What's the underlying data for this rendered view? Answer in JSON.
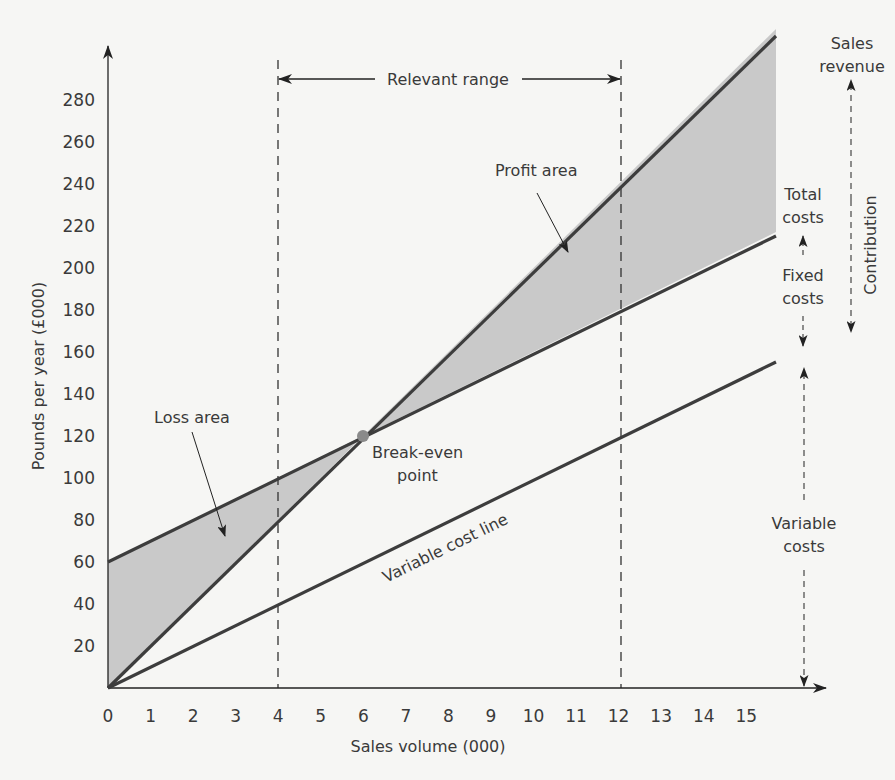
{
  "chart_data": {
    "type": "line",
    "title": "",
    "xlabel": "Sales volume (000)",
    "ylabel": "Pounds per year (£000)",
    "xlim": [
      0,
      16
    ],
    "ylim": [
      0,
      300
    ],
    "x_ticks": [
      0,
      1,
      2,
      3,
      4,
      5,
      6,
      7,
      8,
      9,
      10,
      11,
      12,
      13,
      14,
      15
    ],
    "y_ticks": [
      20,
      40,
      60,
      80,
      100,
      120,
      140,
      160,
      180,
      200,
      220,
      240,
      260,
      280
    ],
    "grid": false,
    "series": [
      {
        "name": "Sales revenue",
        "x": [
          0,
          15.7
        ],
        "values": [
          0,
          314
        ]
      },
      {
        "name": "Total costs",
        "x": [
          0,
          15.7
        ],
        "values": [
          60,
          217
        ]
      },
      {
        "name": "Variable cost line",
        "x": [
          0,
          15.7
        ],
        "values": [
          0,
          157
        ]
      }
    ],
    "break_even": {
      "x": 6,
      "y": 120,
      "label": "Break-even point"
    },
    "relevant_range": {
      "from": 4,
      "to": 12,
      "label": "Relevant range"
    },
    "shaded_areas": [
      {
        "name": "Loss area",
        "from_x": 0,
        "to_x": 6
      },
      {
        "name": "Profit area",
        "from_x": 6,
        "to_x": 15.7
      }
    ],
    "annotations": [
      "Relevant range",
      "Profit area",
      "Loss area",
      "Break-even point",
      "Variable cost line",
      "Sales revenue",
      "Total costs",
      "Fixed costs",
      "Contribution",
      "Variable costs"
    ]
  },
  "labels": {
    "relevant_range": "Relevant range",
    "profit_area": "Profit area",
    "loss_area": "Loss area",
    "break_even_1": "Break-even",
    "break_even_2": "point",
    "variable_cost_line": "Variable cost line",
    "sales_revenue_1": "Sales",
    "sales_revenue_2": "revenue",
    "total_costs_1": "Total",
    "total_costs_2": "costs",
    "fixed_costs_1": "Fixed",
    "fixed_costs_2": "costs",
    "contribution": "Contribution",
    "variable_costs_1": "Variable",
    "variable_costs_2": "costs"
  },
  "colors": {
    "line": "#3d3d3d",
    "shade": "#c9c9c9",
    "text": "#3a3a3a",
    "background": "#f6f6f4"
  }
}
